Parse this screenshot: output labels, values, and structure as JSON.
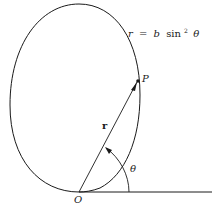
{
  "diagram": {
    "curve_equation": {
      "lhs": "r",
      "equals": "=",
      "coef": "b",
      "func": "sin",
      "power": "2",
      "arg": "θ"
    },
    "point_label": "P",
    "origin_label": "O",
    "vector_label": "r",
    "angle_label": "θ",
    "colors": {
      "stroke": "#1a1a1a",
      "background": "#ffffff"
    }
  }
}
